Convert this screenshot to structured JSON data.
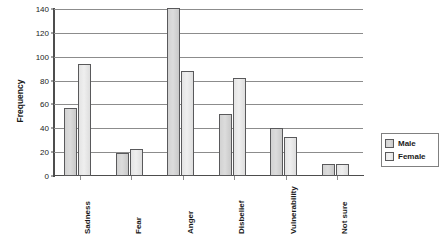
{
  "chart_data": {
    "type": "bar",
    "title": "",
    "xlabel": "",
    "ylabel": "Frequency",
    "ylim": [
      0,
      140
    ],
    "ytick_step": 20,
    "yticks": [
      0,
      20,
      40,
      60,
      80,
      100,
      120,
      140
    ],
    "grid": true,
    "legend_position": "right",
    "categories": [
      "Sadness",
      "Fear",
      "Anger",
      "Disbelief",
      "Vulnerability",
      "Not sure"
    ],
    "series": [
      {
        "name": "Male",
        "color": "#d6d6d6",
        "values": [
          57,
          19,
          141,
          52,
          40,
          10
        ]
      },
      {
        "name": "Female",
        "color": "#ededed",
        "values": [
          94,
          23,
          88,
          82,
          33,
          10
        ]
      }
    ]
  },
  "legend": {
    "items": [
      {
        "label": "Male"
      },
      {
        "label": "Female"
      }
    ]
  }
}
